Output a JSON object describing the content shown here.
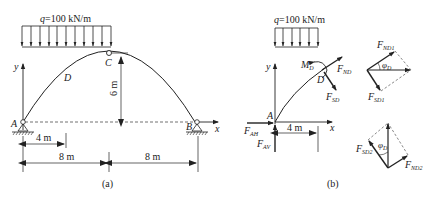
{
  "figure_a": {
    "load_label": "q=100 kN/m",
    "load_symbol": "q",
    "load_value": "=100 kN/m",
    "point_A": "A",
    "point_B": "B",
    "point_C": "C",
    "point_D": "D",
    "axis_x": "x",
    "axis_y": "y",
    "height_dim": "6 m",
    "dim_4m": "4 m",
    "dim_8m_left": "8 m",
    "dim_8m_right": "8 m",
    "caption": "(a)"
  },
  "figure_b": {
    "load_symbol": "q",
    "load_value": "=100 kN/m",
    "point_A": "A",
    "point_D": "D",
    "axis_x": "x",
    "axis_y": "y",
    "moment": "M",
    "moment_sub": "D",
    "F_ND": "F",
    "F_ND_sub": "ND",
    "F_SD": "F",
    "F_SD_sub": "SD",
    "F_AH": "F",
    "F_AH_sub": "AH",
    "F_AV": "F",
    "F_AV_sub": "AV",
    "dim_4m": "4 m",
    "F_ND1_sub": "ND1",
    "F_SD1_sub": "SD1",
    "F_SD2_sub": "SD2",
    "F_ND2_sub": "ND2",
    "phi": "φ",
    "phi_sub": "D",
    "caption": "(b)"
  }
}
